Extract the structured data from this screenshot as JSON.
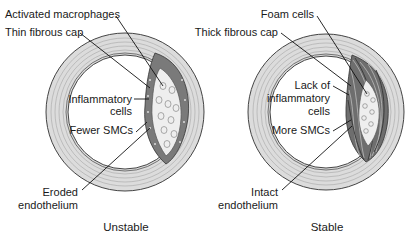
{
  "figure": {
    "panels": [
      {
        "id": "unstable",
        "caption": "Unstable",
        "labels": {
          "activated_macrophages": "Activated macrophages",
          "fibrous_cap": "Thin fibrous cap",
          "inflammatory_line1": "Inflammatory",
          "inflammatory_line2": "cells",
          "smcs": "Fewer SMCs",
          "endothelium_line1": "Eroded",
          "endothelium_line2": "endothelium"
        }
      },
      {
        "id": "stable",
        "caption": "Stable",
        "labels": {
          "foam_cells": "Foam cells",
          "fibrous_cap": "Thick fibrous cap",
          "inflammatory_line1": "Lack of",
          "inflammatory_line2": "inflammatory",
          "inflammatory_line3": "cells",
          "smcs": "More SMCs",
          "endothelium_line1": "Intact",
          "endothelium_line2": "endothelium"
        }
      }
    ],
    "colors": {
      "vessel_wall": "#dcdcdc",
      "fibrous_cap": "#737373",
      "lipid_core": "#eeeeee",
      "outline": "#444444",
      "text": "#1a1a1a"
    }
  }
}
